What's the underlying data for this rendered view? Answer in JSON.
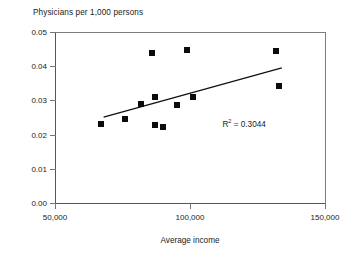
{
  "chart_data": {
    "type": "scatter",
    "title": "Physicians per 1,000 persons",
    "xlabel": "Average income",
    "ylabel": "",
    "xlim": [
      50000,
      150000
    ],
    "ylim": [
      0.0,
      0.05
    ],
    "grid": false,
    "legend": false,
    "x_ticks": [
      50000,
      100000,
      150000
    ],
    "x_tick_labels": [
      "50,000",
      "100,000",
      "150,000"
    ],
    "y_ticks": [
      0.0,
      0.01,
      0.02,
      0.03,
      0.04,
      0.05
    ],
    "y_tick_labels": [
      "0.00",
      "0.01",
      "0.02",
      "0.03",
      "0.04",
      "0.05"
    ],
    "marker_color": "#0c0c0c",
    "marker_shape": "square",
    "points": [
      {
        "x": 67000,
        "y": 0.023
      },
      {
        "x": 76000,
        "y": 0.0247
      },
      {
        "x": 82000,
        "y": 0.029
      },
      {
        "x": 86000,
        "y": 0.044
      },
      {
        "x": 87000,
        "y": 0.031
      },
      {
        "x": 87000,
        "y": 0.0228
      },
      {
        "x": 90000,
        "y": 0.0223
      },
      {
        "x": 95000,
        "y": 0.0288
      },
      {
        "x": 99000,
        "y": 0.0448
      },
      {
        "x": 101000,
        "y": 0.0311
      },
      {
        "x": 132000,
        "y": 0.0445
      },
      {
        "x": 133000,
        "y": 0.0342
      }
    ],
    "trendline": {
      "x_start": 68000,
      "y_start": 0.0251,
      "x_end": 134000,
      "y_end": 0.0395,
      "color": "#111111"
    },
    "annotation": {
      "r_symbol": "R",
      "exponent": "2",
      "equals_value": " = 0.3044",
      "full_text": "R2 = 0.3044",
      "x": 112000,
      "y": 0.0232
    }
  }
}
